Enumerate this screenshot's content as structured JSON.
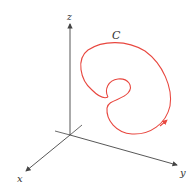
{
  "figure": {
    "type": "3d-space-curve",
    "axes": {
      "x_label": "x",
      "y_label": "y",
      "z_label": "z"
    },
    "curve": {
      "label": "C",
      "color": "#e8473f",
      "has_direction_arrow": true
    },
    "axis_color": "#444444"
  }
}
